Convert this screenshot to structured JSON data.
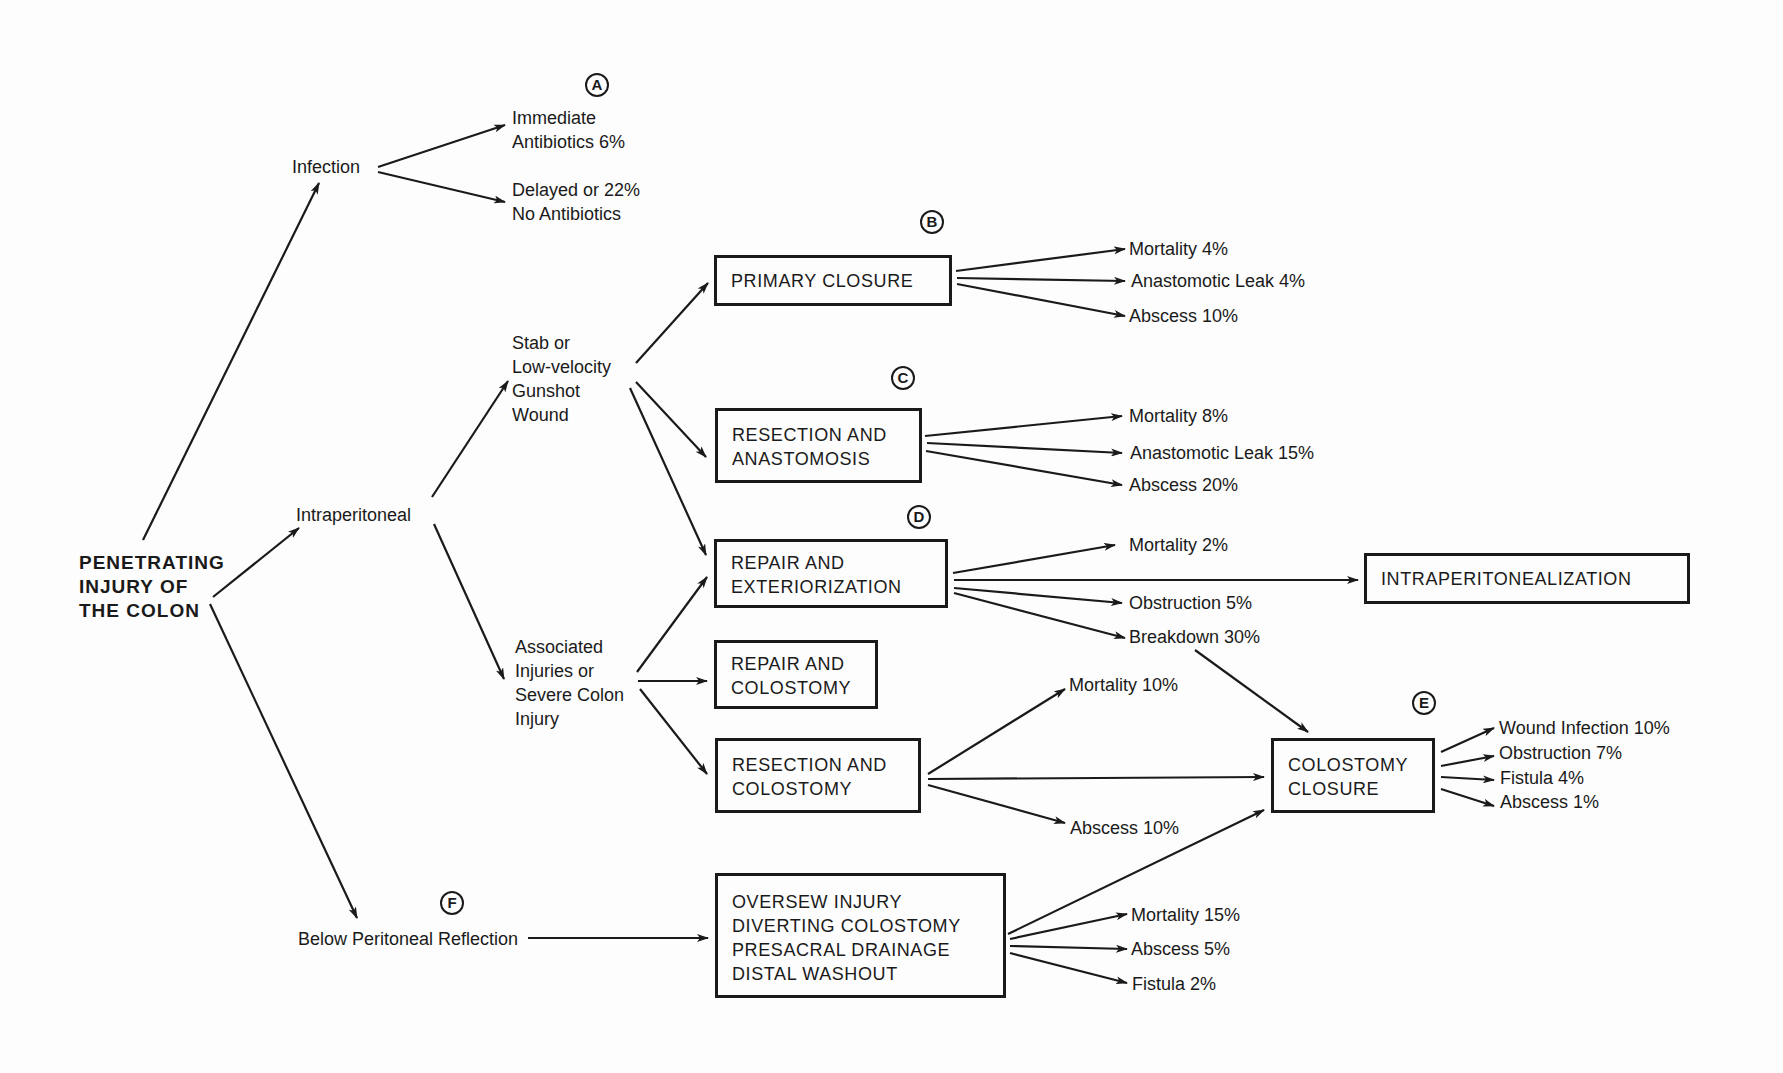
{
  "diagram": {
    "root": "PENETRATING\nINJURY OF\nTHE COLON",
    "branches": {
      "infection": "Infection",
      "intraperitoneal": "Intraperitoneal",
      "below_reflection": "Below Peritoneal Reflection"
    },
    "infection_outcomes": {
      "immediate": "Immediate\nAntibiotics 6%",
      "delayed": "Delayed or 22%\nNo Antibiotics"
    },
    "wound_types": {
      "stab": "Stab or\nLow-velocity\nGunshot\nWound",
      "associated": "Associated\nInjuries or\nSevere Colon\nInjury"
    },
    "procedures": {
      "primary_closure": "PRIMARY CLOSURE",
      "resection_anastomosis": "RESECTION AND\nANASTOMOSIS",
      "repair_exteriorization": "REPAIR AND\nEXTERIORIZATION",
      "repair_colostomy": "REPAIR AND\nCOLOSTOMY",
      "resection_colostomy": "RESECTION AND\nCOLOSTOMY",
      "intraperitonealization": "INTRAPERITONEALIZATION",
      "colostomy_closure": "COLOSTOMY\nCLOSURE",
      "oversew": "OVERSEW INJURY\nDIVERTING COLOSTOMY\nPRESACRAL DRAINAGE\nDISTAL WASHOUT"
    },
    "markers": {
      "a": "A",
      "b": "B",
      "c": "C",
      "d": "D",
      "e": "E",
      "f": "F"
    },
    "outcomes": {
      "primary_closure": [
        "Mortality 4%",
        "Anastomotic Leak 4%",
        "Abscess 10%"
      ],
      "resection_anastomosis": [
        "Mortality 8%",
        "Anastomotic Leak 15%",
        "Abscess 20%"
      ],
      "repair_exteriorization": [
        "Mortality 2%",
        "Obstruction 5%",
        "Breakdown 30%"
      ],
      "resection_colostomy": [
        "Mortality 10%",
        "Abscess 10%"
      ],
      "colostomy_closure": [
        "Wound Infection 10%",
        "Obstruction 7%",
        "Fistula 4%",
        "Abscess 1%"
      ],
      "oversew": [
        "Mortality 15%",
        "Abscess 5%",
        "Fistula 2%"
      ]
    },
    "colors": {
      "ink": "#1a1a1a",
      "paper": "#fdfdfd"
    }
  }
}
